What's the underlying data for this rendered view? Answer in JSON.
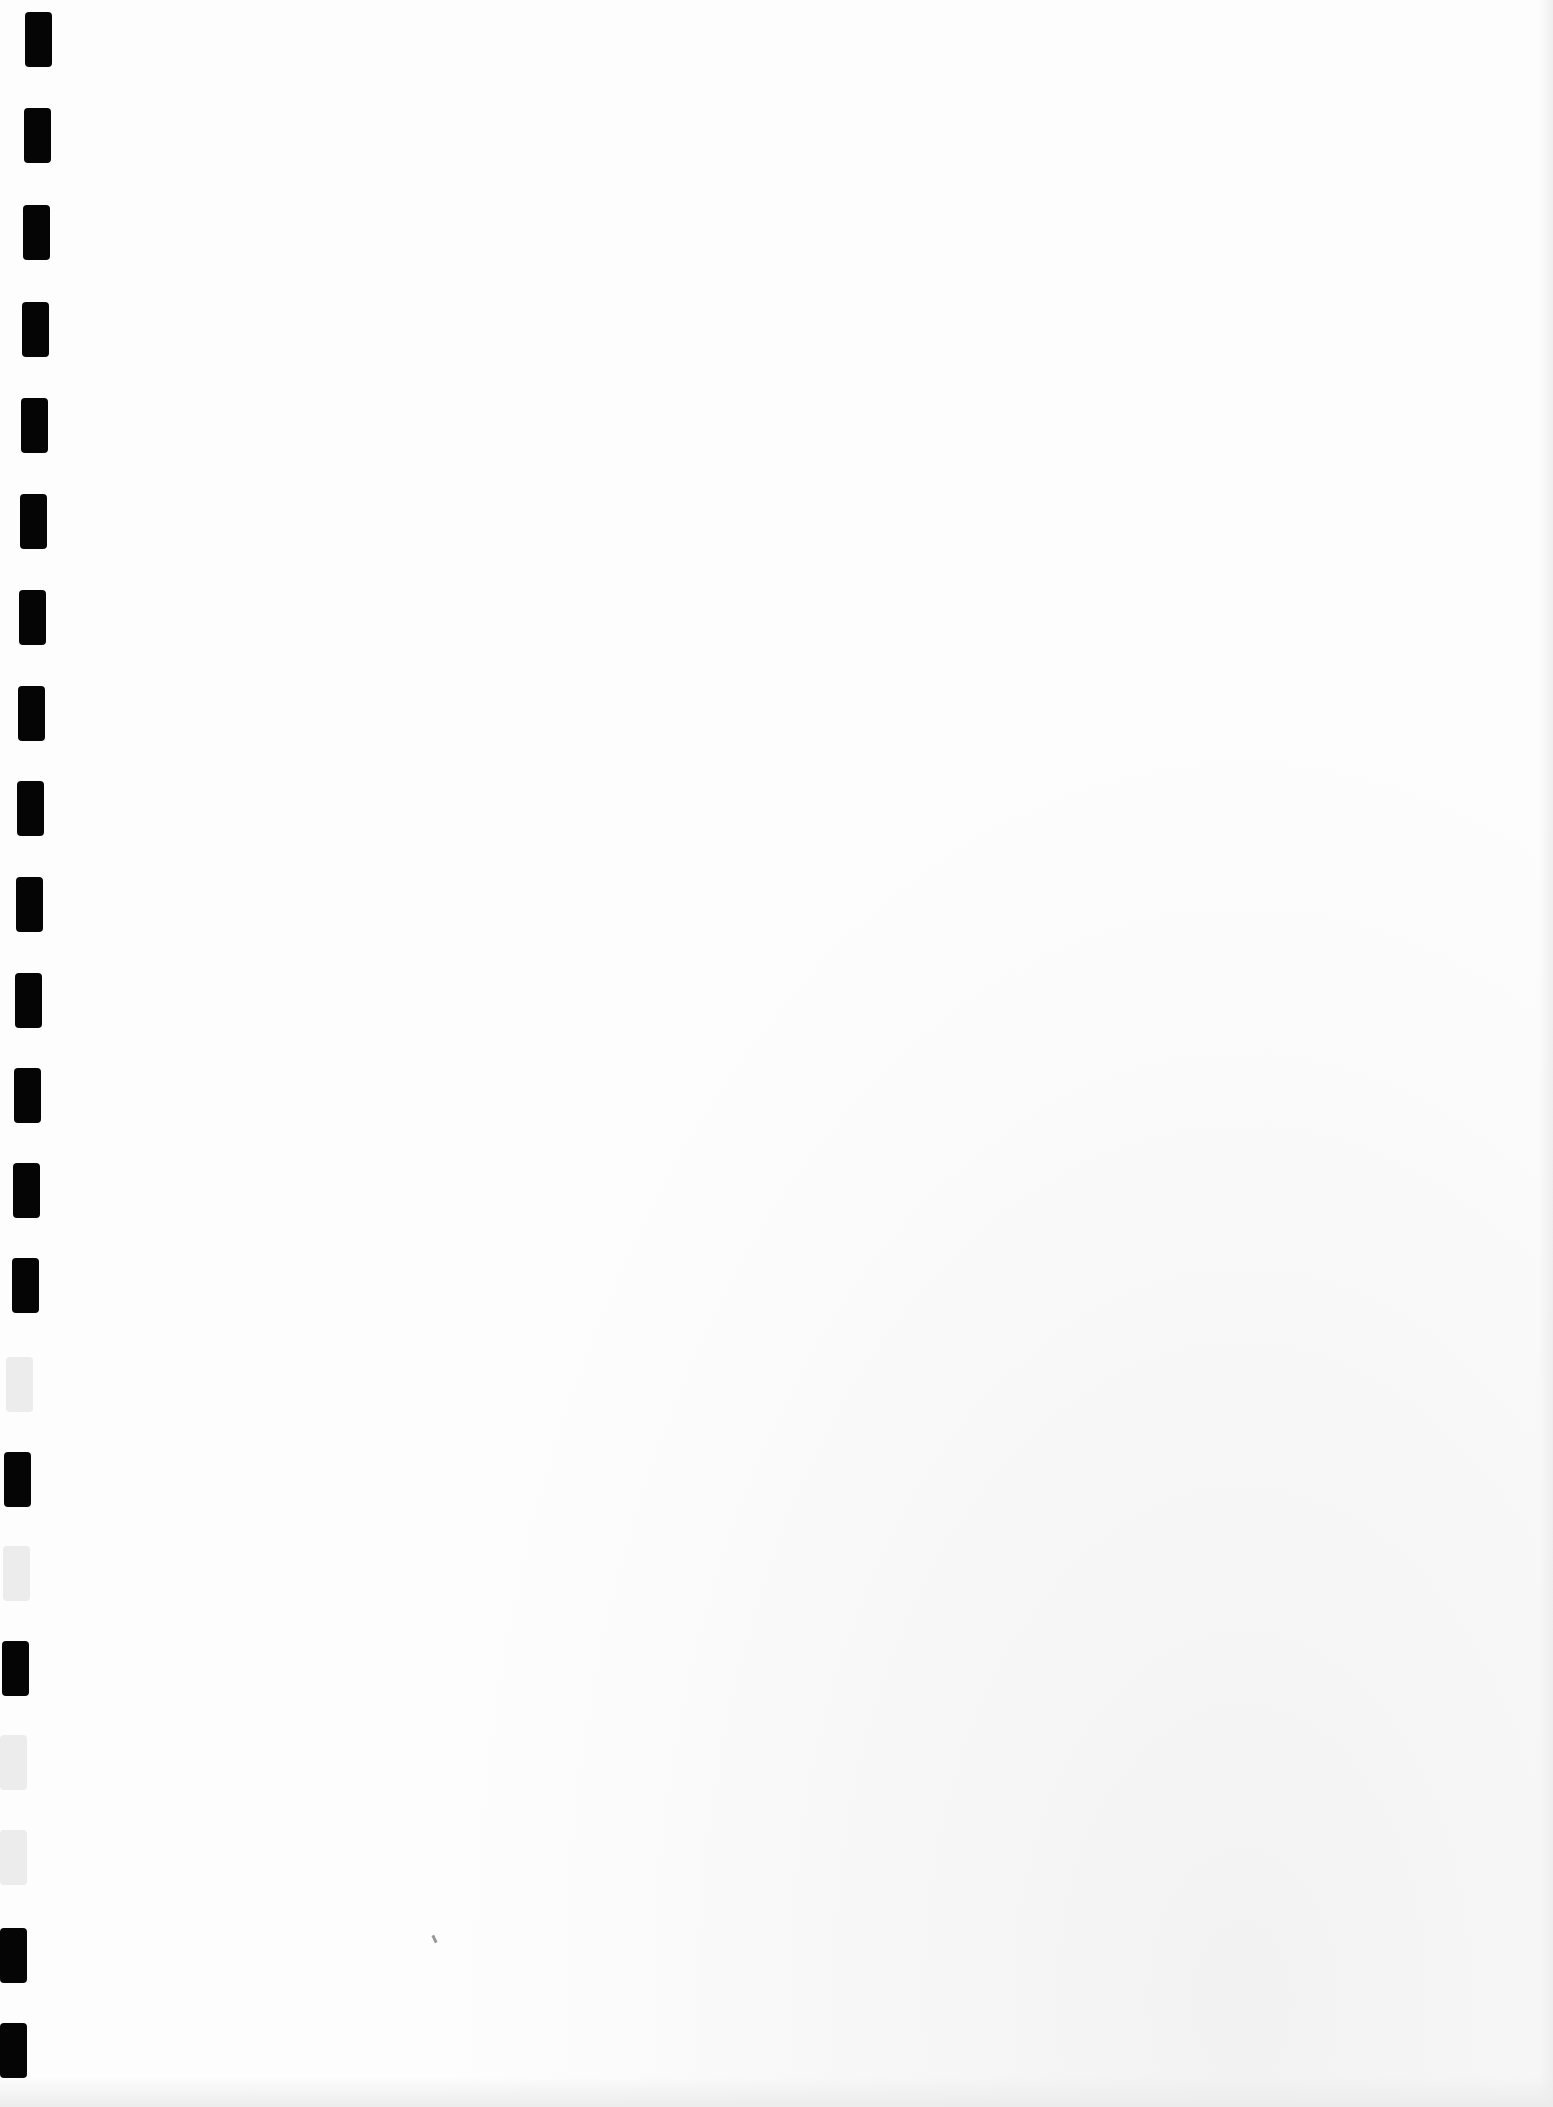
{
  "document": {
    "type": "scanned blank page",
    "content_text": "",
    "binding_holes": {
      "count": 22,
      "color_dark": "#050505",
      "color_light": "#ececec",
      "holes": [
        {
          "x": 25,
          "y": 12,
          "shade": "dark"
        },
        {
          "x": 24,
          "y": 108,
          "shade": "dark"
        },
        {
          "x": 23,
          "y": 205,
          "shade": "dark"
        },
        {
          "x": 22,
          "y": 302,
          "shade": "dark"
        },
        {
          "x": 21,
          "y": 398,
          "shade": "dark"
        },
        {
          "x": 20,
          "y": 494,
          "shade": "dark"
        },
        {
          "x": 19,
          "y": 590,
          "shade": "dark"
        },
        {
          "x": 18,
          "y": 686,
          "shade": "dark"
        },
        {
          "x": 17,
          "y": 781,
          "shade": "dark"
        },
        {
          "x": 16,
          "y": 877,
          "shade": "dark"
        },
        {
          "x": 15,
          "y": 973,
          "shade": "dark"
        },
        {
          "x": 14,
          "y": 1068,
          "shade": "dark"
        },
        {
          "x": 13,
          "y": 1163,
          "shade": "dark"
        },
        {
          "x": 12,
          "y": 1258,
          "shade": "dark"
        },
        {
          "x": 6,
          "y": 1357,
          "shade": "light"
        },
        {
          "x": 4,
          "y": 1452,
          "shade": "dark"
        },
        {
          "x": 3,
          "y": 1546,
          "shade": "light"
        },
        {
          "x": 2,
          "y": 1641,
          "shade": "dark"
        },
        {
          "x": 0,
          "y": 1735,
          "shade": "light"
        },
        {
          "x": 0,
          "y": 1830,
          "shade": "light"
        },
        {
          "x": 0,
          "y": 1928,
          "shade": "dark"
        },
        {
          "x": 0,
          "y": 2023,
          "shade": "dark"
        }
      ]
    }
  }
}
